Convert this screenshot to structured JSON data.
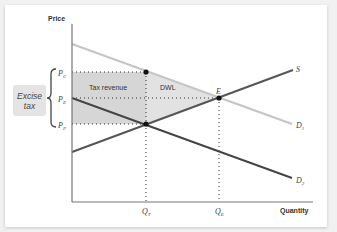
{
  "diagram": {
    "type": "supply-demand-excise-tax",
    "axes": {
      "y_label": "Price",
      "x_label": "Quantity"
    },
    "price_levels": [
      {
        "symbol": "P",
        "subscript": "C"
      },
      {
        "symbol": "P",
        "subscript": "E"
      },
      {
        "symbol": "P",
        "subscript": "P"
      }
    ],
    "quantity_levels": [
      {
        "symbol": "Q",
        "subscript": "T"
      },
      {
        "symbol": "Q",
        "subscript": "E"
      }
    ],
    "curves": [
      {
        "symbol": "S",
        "subscript": "",
        "color": "#555555"
      },
      {
        "symbol": "D",
        "subscript": "1",
        "color": "#c4c4c4"
      },
      {
        "symbol": "D",
        "subscript": "2",
        "color": "#444444"
      }
    ],
    "points": [
      {
        "label": "E"
      }
    ],
    "regions": {
      "tax_revenue": {
        "label": "Tax revenue",
        "color": "#d6d6d6"
      },
      "dwl": {
        "label": "DWL",
        "color": "#e2e2e2"
      }
    },
    "annotation": {
      "line1": "Excise",
      "line2": "tax"
    }
  }
}
